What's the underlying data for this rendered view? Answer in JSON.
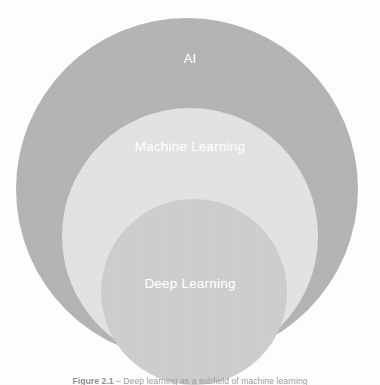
{
  "figure": {
    "kind": "nested-circles-venn",
    "background_color": "#ffffff",
    "caption_label": "Figure 2.1",
    "caption_separator": " – ",
    "caption_text": "Deep learning as a subfield of machine learning",
    "caption_color": "#9aa0a6"
  },
  "chart_data": {
    "type": "venn",
    "title": "",
    "xlabel": "",
    "ylabel": "",
    "grid": false,
    "legend": "none",
    "relationship": "strict containment: Deep Learning ⊂ Machine Learning ⊂ AI",
    "sets": [
      {
        "label": "AI",
        "level": 1,
        "fill": "#b5b5b5",
        "label_color": "#ffffff",
        "center_px": [
          187,
          189
        ],
        "radius_px": 171
      },
      {
        "label": "Machine Learning",
        "level": 2,
        "fill": "#e4e4e4",
        "label_color": "#ffffff",
        "center_px": [
          190,
          236
        ],
        "radius_px": 128
      },
      {
        "label": "Deep Learning",
        "level": 3,
        "fill": "#cfcfcf",
        "label_color": "#ffffff",
        "center_px": [
          194,
          292
        ],
        "radius_px": 93
      }
    ]
  },
  "labels": {
    "ai": "AI",
    "machine_learning": "Machine Learning",
    "deep_learning_first": "Deep",
    "deep_learning_second": "Learning"
  }
}
